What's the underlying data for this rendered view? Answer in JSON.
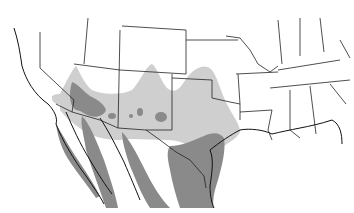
{
  "map": {
    "type": "species-range-map",
    "region": "Southwestern United States and Northern Mexico",
    "colors": {
      "background": "#ffffff",
      "range_light": "#cfcfcf",
      "range_dark": "#8a8a8a",
      "borders": "#222222"
    },
    "legend": {
      "entries": [
        {
          "label": "",
          "color": "#cfcfcf"
        },
        {
          "label": "",
          "color": "#8a8a8a"
        }
      ]
    }
  }
}
